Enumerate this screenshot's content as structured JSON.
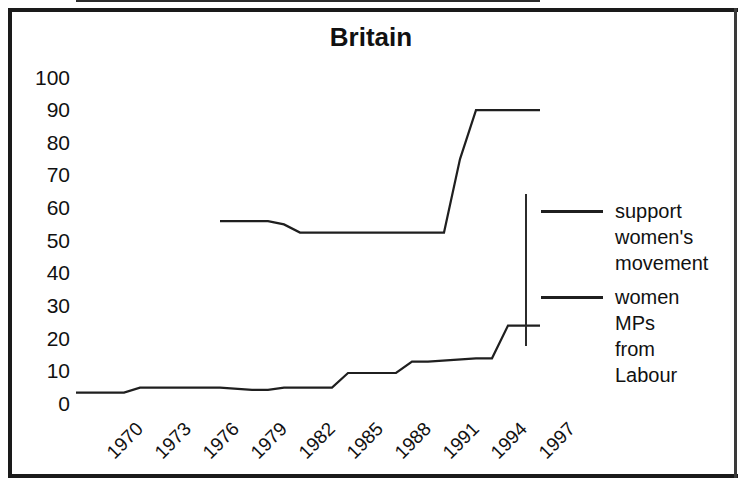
{
  "chart_data": {
    "type": "line",
    "title": "Britain",
    "xlabel": "",
    "ylabel": "",
    "ylim": [
      0,
      100
    ],
    "yticks": [
      100,
      90,
      80,
      70,
      60,
      50,
      40,
      30,
      20,
      10,
      0
    ],
    "xlim": [
      1970,
      1999
    ],
    "xticks": [
      "1970",
      "1973",
      "1976",
      "1979",
      "1982",
      "1985",
      "1988",
      "1991",
      "1994",
      "1997"
    ],
    "grid": false,
    "legend_position": "right",
    "series": [
      {
        "name": "support women's movement",
        "x": [
          1979,
          1982,
          1983,
          1984,
          1993,
          1994,
          1995,
          1999
        ],
        "values": [
          56,
          56,
          55,
          52.5,
          52.5,
          75,
          90,
          90
        ]
      },
      {
        "name": "women MPs from Labour",
        "x": [
          1970,
          1973,
          1974,
          1975,
          1979,
          1981,
          1982,
          1983,
          1986,
          1987,
          1990,
          1991,
          1992,
          1995,
          1996,
          1997,
          1999
        ],
        "values": [
          3.5,
          3.5,
          5,
          5,
          5,
          4.3,
          4.3,
          5,
          5,
          9.5,
          9.5,
          13,
          13,
          14,
          14,
          24,
          24
        ]
      }
    ]
  },
  "legend": {
    "entries": [
      {
        "label": "support\nwomen's\nmovement",
        "color": "#1f1f1f"
      },
      {
        "label": "women MPs\nfrom Labour",
        "color": "#1f1f1f"
      }
    ]
  }
}
